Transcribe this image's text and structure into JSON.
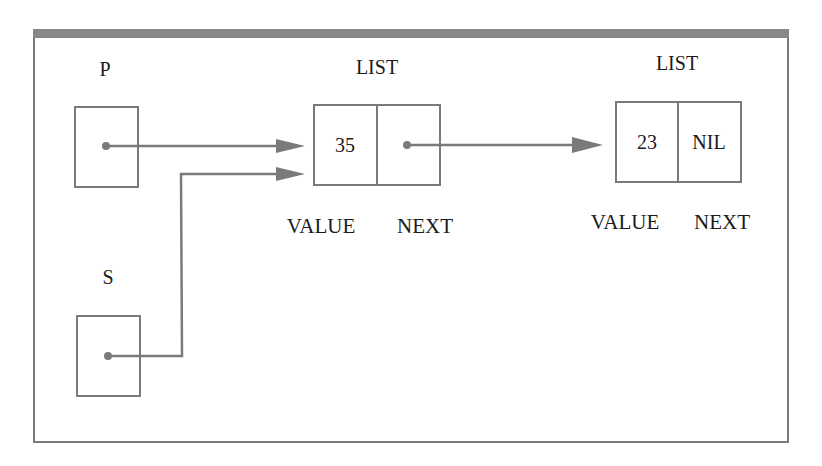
{
  "diagram": {
    "colors": {
      "line": "#7a7a7a",
      "frame_top": "#888888",
      "text": "#1a1a1a"
    },
    "pointers": [
      {
        "name": "P",
        "label": "P"
      },
      {
        "name": "S",
        "label": "S"
      }
    ],
    "nodes": [
      {
        "title": "LIST",
        "value": "35",
        "next": "",
        "value_label": "VALUE",
        "next_label": "NEXT"
      },
      {
        "title": "LIST",
        "value": "23",
        "next": "NIL",
        "value_label": "VALUE",
        "next_label": "NEXT"
      }
    ],
    "edges": [
      {
        "from": "P",
        "to": "node-1"
      },
      {
        "from": "S",
        "to": "node-1"
      },
      {
        "from": "node-1.next",
        "to": "node-2"
      }
    ]
  }
}
